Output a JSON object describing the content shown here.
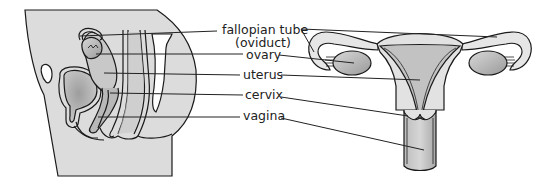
{
  "figure": {
    "panels": [
      {
        "id": "side-view",
        "description": "Sagittal (side) section of female pelvis"
      },
      {
        "id": "front-view",
        "description": "Frontal view of uterus, ovaries and fallopian tubes"
      }
    ]
  },
  "labels": {
    "fallopian_tube": "fallopian tube",
    "oviduct": "(oviduct)",
    "ovary": "ovary",
    "uterus": "uterus",
    "cervix": "cervix",
    "vagina": "vagina"
  },
  "colors": {
    "body_fill": "#dcdcdc",
    "organ_fill": "#c4c4c4",
    "dark_fill": "#a8a8a8",
    "light_fill": "#ececec",
    "outline": "#1a1a1a",
    "text": "#222222",
    "background": "#ffffff"
  }
}
